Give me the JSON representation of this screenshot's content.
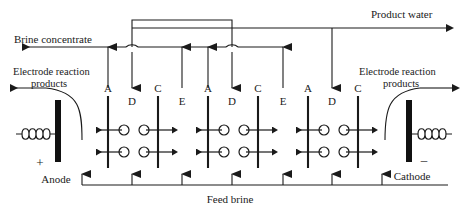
{
  "diagram": {
    "type": "process-flow-diagram",
    "background_color": "#ffffff",
    "line_color": "#1a1a1a",
    "electrode_color": "#111111"
  },
  "labels": {
    "brine_concentrate": "Brine concentrate",
    "product_water": "Product water",
    "feed_brine": "Feed brine",
    "electrode_reaction_left_line1": "Electrode reaction",
    "electrode_reaction_left_line2": "products",
    "electrode_reaction_right_line1": "Electrode reaction",
    "electrode_reaction_right_line2": "products",
    "anode": "Anode",
    "cathode": "Cathode",
    "anode_sign": "+",
    "cathode_sign": "–"
  },
  "membrane_labels": {
    "anion": "A",
    "cation": "C",
    "dilute": "D",
    "concentrate": "E"
  },
  "cells": [
    {
      "index": 1,
      "anion_membrane": "A",
      "dilute_compartment": "D",
      "cation_membrane": "C",
      "concentrate_compartment": "E",
      "ion_rows": 2
    },
    {
      "index": 2,
      "anion_membrane": "A",
      "dilute_compartment": "D",
      "cation_membrane": "C",
      "concentrate_compartment": "E",
      "ion_rows": 2
    },
    {
      "index": 3,
      "anion_membrane": "A",
      "dilute_compartment": "D",
      "cation_membrane": "C",
      "concentrate_compartment": "",
      "ion_rows": 2
    }
  ],
  "streams": {
    "brine_concentrate_direction": "left",
    "product_water_direction": "right",
    "feed_brine_direction": "up",
    "feed_riser_count": 7,
    "product_riser_count": 3,
    "concentrate_riser_count": 4,
    "electrode_products_left_direction": "left",
    "electrode_products_right_direction": "right"
  },
  "geometry": {
    "width": 460,
    "height": 214,
    "brine_line_y": 47,
    "product_line_y": 28,
    "feed_line_y": 185,
    "membrane_top_y": 95,
    "membrane_bottom_y": 168,
    "ion_row_y": [
      130,
      152
    ]
  }
}
